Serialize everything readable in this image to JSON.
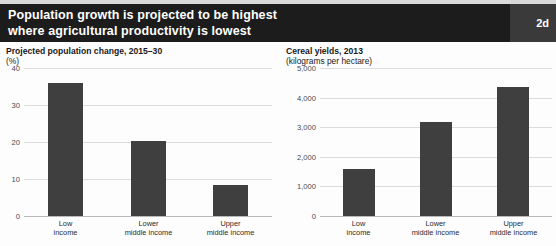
{
  "header": {
    "title_line1": "Population growth is projected to be highest",
    "title_line2": "where agricultural productivity is lowest",
    "badge": "2d",
    "background_color": "#1c1c1c",
    "badge_background_color": "#3a3a3a",
    "text_color": "#ffffff"
  },
  "colors": {
    "bar": "#3f3f3f",
    "gridline": "#dcdcdc",
    "baseline": "#b9b9b9",
    "page_background": "#fdfdfd",
    "top_band": "#d9d9d9"
  },
  "chart_data": [
    {
      "type": "bar",
      "id": "population-change",
      "title": "Projected population change, 2015–30",
      "unit_label": "(%)",
      "xlabel": "",
      "ylabel": "",
      "categories": [
        "Low income",
        "Lower middle income",
        "Upper middle income"
      ],
      "category_lines": [
        [
          "Low",
          "income"
        ],
        [
          "Lower",
          "middle income"
        ],
        [
          "Upper",
          "middle income"
        ]
      ],
      "values": [
        35.9,
        20.4,
        8.3
      ],
      "ylim": [
        0,
        40
      ],
      "yticks": [
        0,
        10,
        20,
        30,
        40
      ],
      "ytick_labels": [
        "0",
        "10",
        "20",
        "30",
        "40"
      ],
      "grid": true,
      "legend": "none"
    },
    {
      "type": "bar",
      "id": "cereal-yields",
      "title": "Cereal yields, 2013",
      "unit_label": "(kilograms per hectare)",
      "xlabel": "",
      "ylabel": "",
      "categories": [
        "Low income",
        "Lower middle income",
        "Upper middle income"
      ],
      "category_lines": [
        [
          "Low",
          "income"
        ],
        [
          "Lower",
          "middle income"
        ],
        [
          "Upper",
          "middle income"
        ]
      ],
      "values": [
        1580,
        3180,
        4350
      ],
      "ylim": [
        0,
        5000
      ],
      "yticks": [
        0,
        1000,
        2000,
        3000,
        4000,
        5000
      ],
      "ytick_labels": [
        "0",
        "1,000",
        "2,000",
        "3,000",
        "4,000",
        "5,000"
      ],
      "grid": true,
      "legend": "none"
    }
  ]
}
